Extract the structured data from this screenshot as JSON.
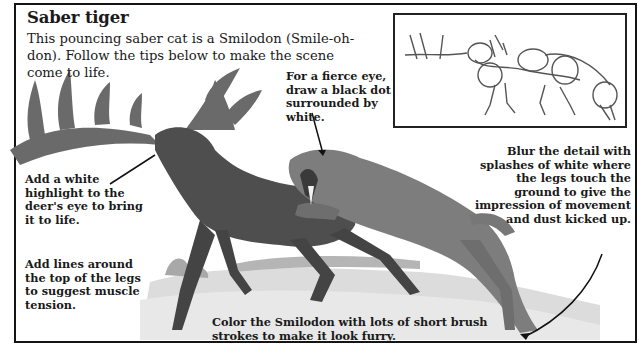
{
  "page": {
    "title": "Saber tiger",
    "intro": "This pouncing saber cat is a Smilodon (Smile-oh-don). Follow the tips below to make the scene come to life."
  },
  "tips": {
    "eye": "For a fierce eye, draw a black dot surrounded by white.",
    "deer_eye": "Add a white highlight to the deer's eye to bring it to life.",
    "legs": "Add lines around the top of the legs to suggest muscle tension.",
    "blur": "Blur the detail with splashes of white where the legs touch the ground to give the impression of movement and dust kicked up.",
    "fur": "Color the Smilodon with lots of short brush strokes to make it look furry."
  },
  "illustration": {
    "main": "Smilodon attacking a giant deer",
    "sketch": "Construction sketch of deer and saber cat"
  },
  "colors": {
    "border": "#141414",
    "text": "#1a1a1a",
    "deer": "#4a4a4a",
    "cat": "#7a7a7a",
    "ground": "#cfcfcf"
  }
}
